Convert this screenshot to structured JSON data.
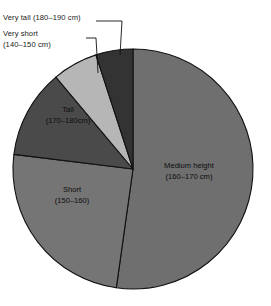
{
  "chart_data": {
    "type": "pie",
    "title": "",
    "subtitle": "",
    "xlabel": "",
    "ylabel": "",
    "legend_position": "none",
    "grid": false,
    "units": "cm",
    "categories": [
      "Medium height (160–170 cm)",
      "Short (150–160)",
      "Tall (170–180cm)",
      "Very short (140–150 cm)",
      "Very tall (180–190 cm)"
    ],
    "values": [
      52.2,
      24.7,
      11.9,
      6.1,
      5.1
    ],
    "slices": [
      {
        "key": "medium-height",
        "name": "Medium height",
        "range": "(160–170 cm)",
        "label_line1": "Medium height",
        "label_line2": "(160–170 cm)",
        "value": 52.2,
        "start_angle": 0,
        "end_angle": 188,
        "color": "#6f6f6f",
        "label_placement": "inside",
        "label_x": 189,
        "label_y": 168
      },
      {
        "key": "short",
        "name": "Short",
        "range": "(150–160)",
        "label_line1": "Short",
        "label_line2": "(150–160)",
        "value": 24.7,
        "start_angle": 188,
        "end_angle": 277,
        "color": "#757575",
        "label_placement": "inside",
        "label_x": 72,
        "label_y": 192
      },
      {
        "key": "tall",
        "name": "Tall",
        "range": "(170–180cm)",
        "label_line1": "Tall",
        "label_line2": "(170–180cm)",
        "value": 11.9,
        "start_angle": 277,
        "end_angle": 320,
        "color": "#4a4a4a",
        "label_placement": "inside",
        "label_x": 68,
        "label_y": 112
      },
      {
        "key": "very-short",
        "name": "Very short",
        "range": "(140–150 cm)",
        "label_line1": "Very short",
        "label_line2": "(140–150 cm)",
        "value": 6.1,
        "start_angle": 320,
        "end_angle": 342,
        "color": "#b6b6b6",
        "label_placement": "callout",
        "leader_from_x": 86,
        "leader_from_y": 38,
        "leader_mid_x": 96,
        "leader_mid_y": 38,
        "leader_to_x": 98,
        "leader_to_y": 73
      },
      {
        "key": "very-tall",
        "name": "Very tall",
        "range": "(180–190 cm)",
        "label_line1": "Very tall",
        "label_line2": "(180–190 cm)",
        "value": 5.1,
        "start_angle": 342,
        "end_angle": 360,
        "color": "#333333",
        "label_placement": "callout",
        "leader_from_x": 96,
        "leader_from_y": 21,
        "leader_mid_x": 122,
        "leader_mid_y": 21,
        "leader_to_x": 120,
        "leader_to_y": 55
      }
    ],
    "geometry": {
      "center_x": 133,
      "center_y": 169,
      "radius": 120
    }
  },
  "callouts": {
    "very_tall": "Very tall (180–190 cm)",
    "very_short_line1": "Very short",
    "very_short_line2": "(140–150 cm)"
  },
  "colors": {
    "background": "#ffffff",
    "outline": "#111111",
    "text": "#1a1a1a",
    "medium_height": "#6f6f6f",
    "short": "#757575",
    "tall": "#4a4a4a",
    "very_short": "#b6b6b6",
    "very_tall": "#333333"
  }
}
